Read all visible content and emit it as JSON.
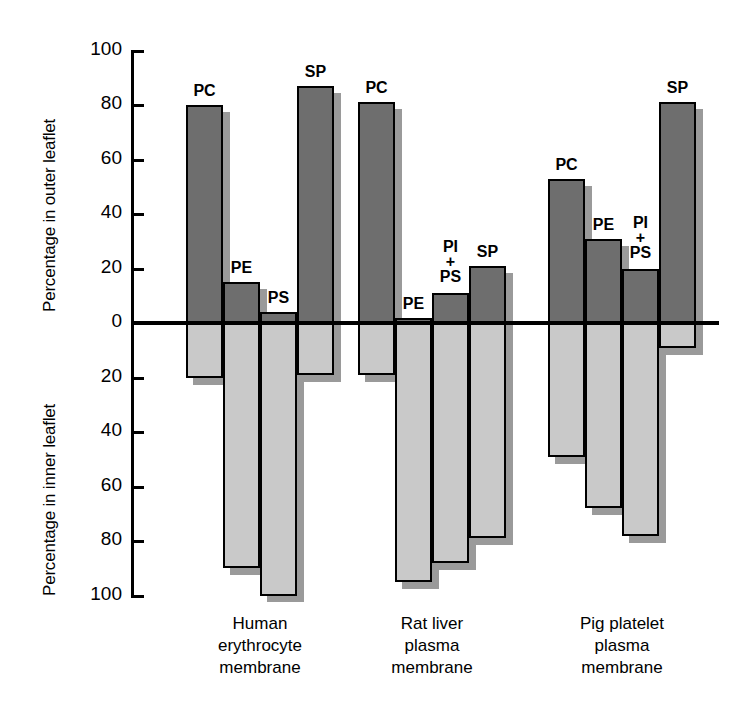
{
  "chart_data": {
    "type": "bar",
    "title": "",
    "subtitle": "",
    "orientation": "vertical-diverging",
    "ylabel_top": "Percentage in outer leaflet",
    "ylabel_bottom": "Percentage in inner leaflet",
    "xlabel": "",
    "ylim_top": [
      0,
      100
    ],
    "ylim_bottom": [
      0,
      100
    ],
    "grid": false,
    "legend": "none",
    "tick_labels_top": [
      "100",
      "80",
      "60",
      "40",
      "20",
      "0"
    ],
    "tick_labels_bottom": [
      "20",
      "40",
      "60",
      "80",
      "100"
    ],
    "tick_values_top": [
      100,
      80,
      60,
      40,
      20,
      0
    ],
    "tick_values_bottom": [
      20,
      40,
      60,
      80,
      100
    ],
    "categories": [
      "PC",
      "PE",
      "PS",
      "SP",
      "PI\n+\nPS"
    ],
    "series": [
      {
        "name": "outer leaflet",
        "color": "#6e6e6e"
      },
      {
        "name": "inner leaflet",
        "color": "#c9c9c9"
      }
    ],
    "groups": [
      {
        "caption": "Human\nerythrocyte\nmembrane",
        "bars": [
          {
            "label": "PC",
            "outer": 80,
            "inner": 20
          },
          {
            "label": "PE",
            "outer": 15,
            "inner": 90
          },
          {
            "label": "PS",
            "outer": 4,
            "inner": 100
          },
          {
            "label": "SP",
            "outer": 87,
            "inner": 19
          }
        ]
      },
      {
        "caption": "Rat liver\nplasma\nmembrane",
        "bars": [
          {
            "label": "PC",
            "outer": 81,
            "inner": 19
          },
          {
            "label": "PE",
            "outer": 2,
            "inner": 95
          },
          {
            "label": "PI\n+\nPS",
            "outer": 11,
            "inner": 88
          },
          {
            "label": "SP",
            "outer": 21,
            "inner": 79
          }
        ]
      },
      {
        "caption": "Pig platelet\nplasma\nmembrane",
        "bars": [
          {
            "label": "PC",
            "outer": 53,
            "inner": 49
          },
          {
            "label": "PE",
            "outer": 31,
            "inner": 68
          },
          {
            "label": "PI\n+\nPS",
            "outer": 20,
            "inner": 78
          },
          {
            "label": "SP",
            "outer": 81,
            "inner": 9
          }
        ]
      }
    ]
  },
  "axis": {
    "title_outer": "Percentage in outer leaflet",
    "title_inner": "Percentage in inner leaflet"
  },
  "colors": {
    "outer_bar": "#6e6e6e",
    "inner_bar": "#c9c9c9",
    "shadow": "#9a9a9a",
    "axis": "#000000",
    "background": "#ffffff"
  }
}
